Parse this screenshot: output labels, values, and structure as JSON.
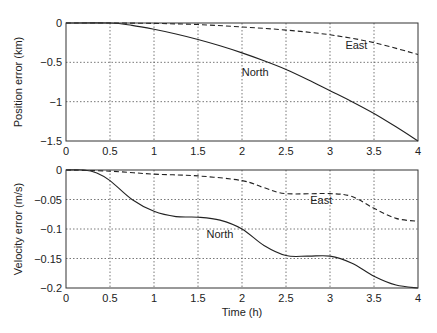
{
  "chart_data": [
    {
      "type": "line",
      "title": "",
      "xlabel": "",
      "ylabel": "Position error (km)",
      "xlim": [
        0,
        4
      ],
      "ylim": [
        -1.5,
        0
      ],
      "xticks": [
        "0",
        "0.5",
        "1",
        "1.5",
        "2",
        "2.5",
        "3",
        "3.5",
        "4"
      ],
      "yticks": [
        "0",
        "-0.5",
        "-1",
        "-1.5"
      ],
      "grid": true,
      "series": [
        {
          "name": "North",
          "style": "solid",
          "x": [
            0,
            0.5,
            0.75,
            1,
            1.25,
            1.5,
            1.75,
            2,
            2.25,
            2.5,
            2.75,
            3,
            3.25,
            3.5,
            3.75,
            4
          ],
          "y": [
            0,
            0,
            -0.03,
            -0.08,
            -0.14,
            -0.21,
            -0.29,
            -0.38,
            -0.48,
            -0.59,
            -0.72,
            -0.86,
            -1.0,
            -1.15,
            -1.32,
            -1.5
          ]
        },
        {
          "name": "East",
          "style": "dashed",
          "x": [
            0,
            0.5,
            1,
            1.5,
            2,
            2.5,
            3,
            3.5,
            4
          ],
          "y": [
            0,
            0,
            -0.005,
            -0.02,
            -0.05,
            -0.09,
            -0.15,
            -0.25,
            -0.4
          ]
        }
      ],
      "annotations": [
        {
          "text": "North",
          "x": 2.15,
          "y": -0.68
        },
        {
          "text": "East",
          "x": 3.3,
          "y": -0.33
        }
      ]
    },
    {
      "type": "line",
      "title": "",
      "xlabel": "Time (h)",
      "ylabel": "Velocity error (m/s)",
      "xlim": [
        0,
        4
      ],
      "ylim": [
        -0.2,
        0
      ],
      "xticks": [
        "0",
        "0.5",
        "1",
        "1.5",
        "2",
        "2.5",
        "3",
        "3.5",
        "4"
      ],
      "yticks": [
        "0",
        "-0.05",
        "-0.1",
        "-0.15",
        "-0.2"
      ],
      "grid": true,
      "series": [
        {
          "name": "North",
          "style": "solid",
          "x": [
            0,
            0.2,
            0.35,
            0.5,
            0.75,
            1,
            1.25,
            1.5,
            1.75,
            2,
            2.25,
            2.5,
            2.75,
            3,
            3.25,
            3.5,
            3.75,
            4
          ],
          "y": [
            0,
            0,
            -0.005,
            -0.018,
            -0.05,
            -0.07,
            -0.079,
            -0.08,
            -0.085,
            -0.1,
            -0.128,
            -0.145,
            -0.146,
            -0.146,
            -0.158,
            -0.18,
            -0.195,
            -0.2
          ]
        },
        {
          "name": "East",
          "style": "dashed",
          "x": [
            0,
            0.5,
            1,
            1.5,
            2,
            2.25,
            2.5,
            3,
            3.25,
            3.5,
            3.75,
            4
          ],
          "y": [
            0,
            -0.002,
            -0.007,
            -0.01,
            -0.018,
            -0.03,
            -0.04,
            -0.04,
            -0.045,
            -0.065,
            -0.082,
            -0.087
          ]
        }
      ],
      "annotations": [
        {
          "text": "North",
          "x": 1.75,
          "y": -0.115
        },
        {
          "text": "East",
          "x": 2.9,
          "y": -0.058
        }
      ]
    }
  ]
}
